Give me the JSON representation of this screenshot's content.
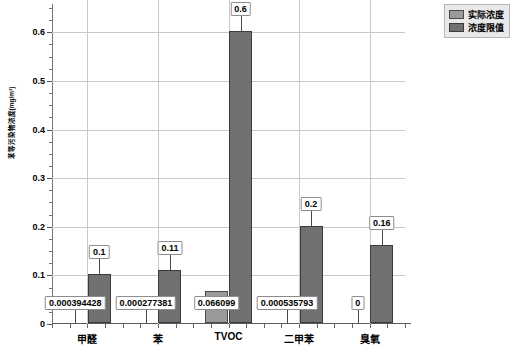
{
  "chart_data": {
    "type": "bar",
    "title": "",
    "xlabel": "",
    "ylabel": "苯等污染物浓度(mg/m³)",
    "categories": [
      "甲醛",
      "苯",
      "TVOC",
      "二甲苯",
      "臭氧"
    ],
    "series": [
      {
        "name": "实际浓度",
        "color": "#9a9a9a",
        "values": [
          0.000394428,
          0.000277381,
          0.066099,
          0.000535793,
          0
        ],
        "labels": [
          "0.000394428",
          "0.000277381",
          "0.066099",
          "0.000535793",
          "0"
        ]
      },
      {
        "name": "浓度限值",
        "color": "#707070",
        "values": [
          0.1,
          0.11,
          0.6,
          0.2,
          0.16
        ],
        "labels": [
          "0.1",
          "0.11",
          "0.6",
          "0.2",
          "0.16"
        ]
      }
    ],
    "ylim": [
      0,
      0.65
    ],
    "yticks": [
      0,
      0.1,
      0.2,
      0.3,
      0.4,
      0.5,
      0.6
    ],
    "ytick_labels": [
      "0",
      "0.1",
      "0.2",
      "0.3",
      "0.4",
      "0.5",
      "0.6"
    ],
    "grid": true,
    "legend_position": "top-right"
  },
  "legend": {
    "items": [
      {
        "label": "实际浓度"
      },
      {
        "label": "浓度限值"
      }
    ]
  },
  "caption": {
    "text": ""
  }
}
